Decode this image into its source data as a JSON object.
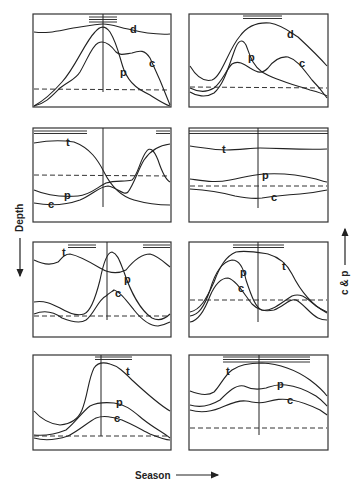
{
  "axes": {
    "x_label": "Season",
    "y_left_label": "Depth",
    "y_right_label": "c & p"
  },
  "panels": [
    {
      "id": "row1-left",
      "curve_labels": [
        "d",
        "p",
        "c"
      ]
    },
    {
      "id": "row1-right",
      "curve_labels": [
        "d",
        "p",
        "c"
      ]
    },
    {
      "id": "row2-left",
      "curve_labels": [
        "t",
        "p",
        "c"
      ]
    },
    {
      "id": "row2-right",
      "curve_labels": [
        "t",
        "p",
        "c"
      ]
    },
    {
      "id": "row3-left",
      "curve_labels": [
        "t",
        "p",
        "c"
      ]
    },
    {
      "id": "row3-right",
      "curve_labels": [
        "t",
        "p",
        "c"
      ]
    },
    {
      "id": "row4-left",
      "curve_labels": [
        "t",
        "p",
        "c"
      ]
    },
    {
      "id": "row4-right",
      "curve_labels": [
        "t",
        "p",
        "c"
      ]
    }
  ]
}
